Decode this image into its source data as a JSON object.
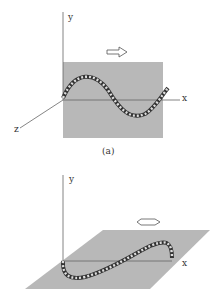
{
  "fig_a": {
    "y_label": "y",
    "x_label": "x",
    "z_label": "z",
    "caption": "(a)"
  },
  "fig_b": {
    "y_label": "y",
    "x_label": "x"
  },
  "colors": {
    "plane": "#b5b5b5",
    "axis": "#555555"
  }
}
